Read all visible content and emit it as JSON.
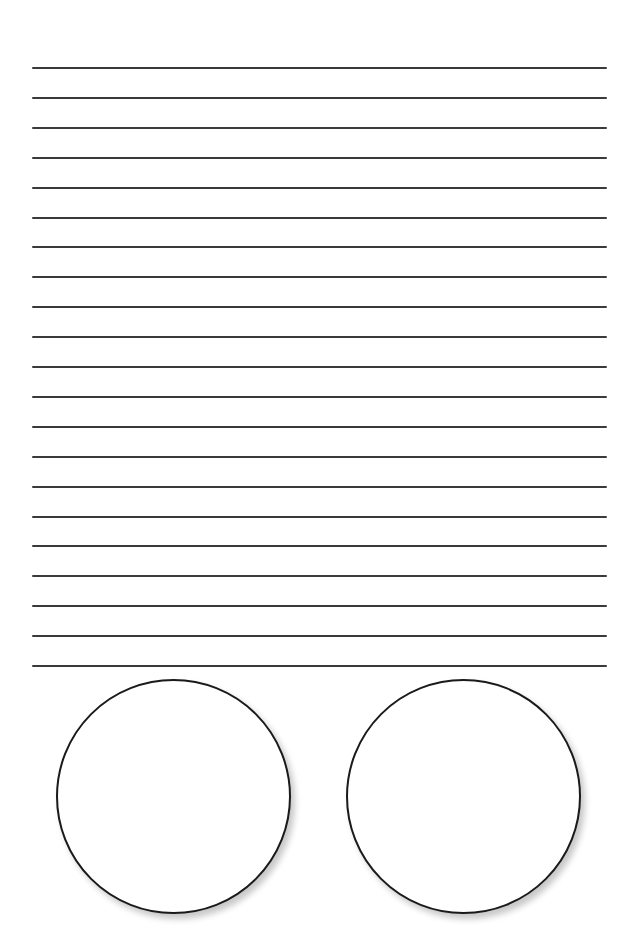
{
  "page": {
    "background": "#ffffff",
    "ruled_lines": {
      "count": 21,
      "start_y": 68,
      "spacing": 29.9,
      "left": 32,
      "right": 607,
      "color": "#3a3a3a"
    },
    "circles": [
      {
        "label": "",
        "left": 56,
        "top": 679,
        "diameter": 236
      },
      {
        "label": "",
        "left": 346,
        "top": 679,
        "diameter": 236
      }
    ]
  }
}
